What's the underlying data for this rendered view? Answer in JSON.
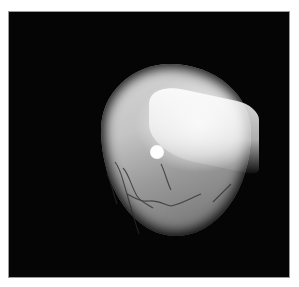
{
  "image": {
    "subject": "retinal fundus photograph",
    "colors": {
      "background": "#ffffff",
      "frame": "#050505",
      "border": "#9a9a9a",
      "optic_disc": "#ffffff"
    }
  }
}
